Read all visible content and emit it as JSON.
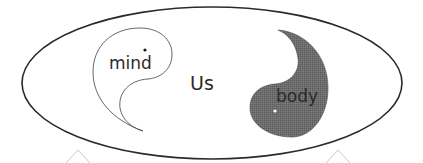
{
  "diagram": {
    "title": "",
    "container": {
      "shape": "ellipse",
      "label": "Us"
    },
    "nodes": [
      {
        "id": "mind",
        "label": "mind",
        "style": "outline",
        "fill": "#ffffff",
        "dot_color": "#1a1a1a"
      },
      {
        "id": "body",
        "label": "body",
        "style": "filled",
        "fill": "#6a6a6a",
        "dot_color": "#ffffff"
      }
    ],
    "colors": {
      "stroke": "#2b2b2b",
      "mind_stroke": "#555555",
      "body_fill": "#6a6a6a",
      "text": "#2a2a2a",
      "background": "#ffffff"
    }
  }
}
